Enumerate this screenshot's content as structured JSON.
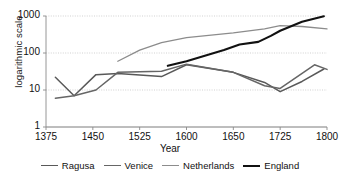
{
  "chart_data": {
    "type": "line",
    "title": "",
    "xlabel": "Year",
    "ylabel": "logarithmic scale",
    "yscale": "log",
    "ylim": [
      1,
      1000
    ],
    "yticks": [
      1,
      10,
      100,
      1000
    ],
    "ytick_labels": [
      "1",
      "10",
      "100",
      "1000"
    ],
    "xticks": [
      1375,
      1450,
      1525,
      1600,
      1650,
      1725,
      1800
    ],
    "xtick_labels": [
      "1375",
      "1450",
      "1525",
      "1600",
      "1650",
      "1725",
      "1800"
    ],
    "grid": true,
    "grid_axis": "y",
    "legend_position": "bottom",
    "series": [
      {
        "name": "Ragusa",
        "color": "#595959",
        "width": 1.5,
        "x": [
          1390,
          1420,
          1455,
          1490,
          1560,
          1600,
          1650,
          1700,
          1725,
          1760,
          1795
        ],
        "y": [
          22,
          7,
          26,
          28,
          23,
          48,
          30,
          16,
          9,
          17,
          37
        ]
      },
      {
        "name": "Venice",
        "color": "#666666",
        "width": 1.5,
        "x": [
          1390,
          1420,
          1455,
          1490,
          1560,
          1600,
          1650,
          1700,
          1725,
          1780,
          1800
        ],
        "y": [
          6,
          7,
          10,
          30,
          32,
          50,
          30,
          13,
          11,
          48,
          36
        ]
      },
      {
        "name": "Netherlands",
        "color": "#8c8c8c",
        "width": 1.3,
        "x": [
          1490,
          1525,
          1560,
          1600,
          1650,
          1700,
          1725,
          1760,
          1800
        ],
        "y": [
          60,
          120,
          190,
          260,
          350,
          450,
          550,
          520,
          450
        ]
      },
      {
        "name": "England",
        "color": "#111111",
        "width": 2.1,
        "x": [
          1570,
          1600,
          1640,
          1660,
          1690,
          1710,
          1725,
          1760,
          1795
        ],
        "y": [
          45,
          60,
          120,
          170,
          200,
          290,
          400,
          700,
          980
        ]
      }
    ]
  },
  "legend": {
    "items": [
      {
        "label": "Ragusa"
      },
      {
        "label": "Venice"
      },
      {
        "label": "Netherlands"
      },
      {
        "label": "England"
      }
    ]
  }
}
